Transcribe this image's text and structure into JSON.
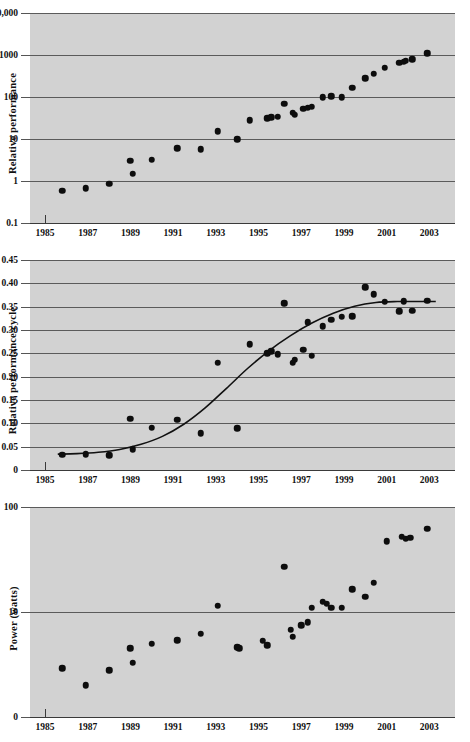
{
  "figure": {
    "background": "#ffffff",
    "panel_color": "#d2d2d2",
    "grid_color": "#5b5b5b",
    "marker_color": "#0d0d0d",
    "curve_color": "#111111"
  },
  "charts": [
    {
      "id": "chart1",
      "type": "scatter",
      "ylabel": "Relative performance",
      "xlabel": "",
      "yscale": "log",
      "xscale": "linear",
      "grid": true,
      "legend": null,
      "ylim": [
        0.1,
        10000
      ],
      "xlim": [
        1984.3,
        2004.2
      ],
      "yticks": [
        0.1,
        1,
        10,
        100,
        1000,
        10000
      ],
      "ytick_labels": [
        "0.1",
        "1",
        "10",
        "100",
        "1000",
        "10,000"
      ],
      "xticks": [
        1985,
        1987,
        1989,
        1991,
        1993,
        1995,
        1997,
        1999,
        2001,
        2003
      ],
      "xtick_labels": [
        "1985",
        "1987",
        "1989",
        "1991",
        "1993",
        "1995",
        "1997",
        "1999",
        "2001",
        "2003"
      ],
      "origin_tick_x": 1985,
      "x": [
        1985.8,
        1986.9,
        1988.0,
        1989.0,
        1989.1,
        1990.0,
        1991.2,
        1992.3,
        1993.1,
        1994.0,
        1994.6,
        1995.4,
        1995.6,
        1995.9,
        1996.2,
        1996.6,
        1996.7,
        1997.1,
        1997.3,
        1997.5,
        1998.0,
        1998.4,
        1998.9,
        1999.4,
        2000.0,
        2000.4,
        2000.9,
        2001.6,
        2001.8,
        2001.9,
        2002.2,
        2002.9
      ],
      "y": [
        0.58,
        0.67,
        0.86,
        3.0,
        1.5,
        3.2,
        6.1,
        5.7,
        15.5,
        10.0,
        28.0,
        31.0,
        33.0,
        34.0,
        70.0,
        42.0,
        38.0,
        52.0,
        55.0,
        58.0,
        98.0,
        105.0,
        100.0,
        165.0,
        280.0,
        360.0,
        500.0,
        650.0,
        700.0,
        720.0,
        800.0,
        1100.0
      ]
    },
    {
      "id": "chart2",
      "type": "scatter",
      "ylabel": "Relative performance/cycle",
      "xlabel": "",
      "yscale": "linear",
      "xscale": "linear",
      "grid": true,
      "legend": null,
      "ylim": [
        0,
        0.45
      ],
      "xlim": [
        1984.3,
        2004.2
      ],
      "yticks": [
        0,
        0.05,
        0.1,
        0.15,
        0.2,
        0.25,
        0.3,
        0.35,
        0.4,
        0.45
      ],
      "ytick_labels": [
        "0",
        "0.05",
        "0.10",
        "0.15",
        "0.20",
        "0.25",
        "0.30",
        "0.35",
        "0.40",
        "0.45"
      ],
      "xticks": [
        1985,
        1987,
        1989,
        1991,
        1993,
        1995,
        1997,
        1999,
        2001,
        2003
      ],
      "xtick_labels": [
        "1985",
        "1987",
        "1989",
        "1991",
        "1993",
        "1995",
        "1997",
        "1999",
        "2001",
        "2003"
      ],
      "origin_tick_x": 1985,
      "x": [
        1985.8,
        1986.9,
        1988.0,
        1989.0,
        1989.1,
        1990.0,
        1991.2,
        1992.3,
        1993.1,
        1994.0,
        1994.6,
        1995.4,
        1995.6,
        1995.9,
        1996.2,
        1996.6,
        1996.7,
        1997.1,
        1997.3,
        1997.5,
        1998.0,
        1998.4,
        1998.9,
        1999.4,
        2000.0,
        2000.4,
        2000.9,
        2001.6,
        2001.8,
        2002.2,
        2002.9
      ],
      "y": [
        0.033,
        0.034,
        0.032,
        0.11,
        0.044,
        0.091,
        0.108,
        0.079,
        0.23,
        0.09,
        0.27,
        0.25,
        0.255,
        0.248,
        0.357,
        0.23,
        0.236,
        0.258,
        0.317,
        0.245,
        0.308,
        0.322,
        0.328,
        0.33,
        0.392,
        0.377,
        0.361,
        0.34,
        0.362,
        0.341,
        0.363
      ],
      "fit_curve": {
        "label": "sigmoid fit",
        "x": [
          1985.6,
          1986.5,
          1987.5,
          1988.5,
          1989.5,
          1990.5,
          1991.5,
          1992.5,
          1993.5,
          1994.5,
          1995.5,
          1996.5,
          1997.5,
          1998.5,
          1999.5,
          2000.5,
          2001.5,
          2002.5,
          2003.3
        ],
        "y": [
          0.034,
          0.035,
          0.038,
          0.044,
          0.055,
          0.072,
          0.098,
          0.133,
          0.175,
          0.218,
          0.256,
          0.288,
          0.315,
          0.336,
          0.351,
          0.359,
          0.361,
          0.361,
          0.361
        ]
      }
    },
    {
      "id": "chart3",
      "type": "scatter",
      "ylabel": "Power (watts)",
      "xlabel": "",
      "yscale": "log",
      "xscale": "linear",
      "grid": true,
      "legend": null,
      "ylim": [
        1,
        100
      ],
      "xlim": [
        1984.3,
        2004.2
      ],
      "yticks": [
        1,
        10,
        100
      ],
      "ytick_labels": [
        "0",
        "10",
        "100"
      ],
      "xticks": [
        1985,
        1987,
        1989,
        1991,
        1993,
        1995,
        1997,
        1999,
        2001,
        2003
      ],
      "xtick_labels": [
        "1985",
        "1987",
        "1989",
        "1991",
        "1993",
        "1995",
        "1997",
        "1999",
        "2001",
        "2003"
      ],
      "origin_tick_x": 1985,
      "x": [
        1985.8,
        1986.9,
        1988.0,
        1989.0,
        1989.1,
        1990.0,
        1991.2,
        1992.3,
        1994.0,
        1994.1,
        1993.1,
        1995.2,
        1995.4,
        1996.2,
        1996.5,
        1996.6,
        1997.0,
        1997.3,
        1997.5,
        1998.0,
        1998.2,
        1998.4,
        1998.9,
        1999.4,
        2000.0,
        2000.4,
        2001.0,
        2001.7,
        2001.9,
        2002.1,
        2002.9
      ],
      "y": [
        2.9,
        2.0,
        2.8,
        4.5,
        3.3,
        5.0,
        5.4,
        6.2,
        4.6,
        4.5,
        11.5,
        5.3,
        4.8,
        27.0,
        6.8,
        5.8,
        7.5,
        8.0,
        11.0,
        12.5,
        12.0,
        11.0,
        11.0,
        16.5,
        14.0,
        19.0,
        47.0,
        52.0,
        50.0,
        51.0,
        62.0
      ]
    }
  ]
}
